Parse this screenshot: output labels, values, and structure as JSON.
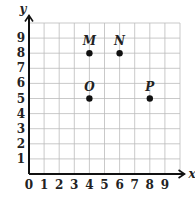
{
  "chart_data": {
    "type": "scatter",
    "title": "",
    "xlabel": "x",
    "ylabel": "y",
    "xlim": [
      0,
      10
    ],
    "ylim": [
      0,
      10
    ],
    "grid": true,
    "x_ticks": [
      "0",
      "1",
      "2",
      "3",
      "4",
      "5",
      "6",
      "7",
      "8",
      "9"
    ],
    "y_ticks": [
      "1",
      "2",
      "3",
      "4",
      "5",
      "6",
      "7",
      "8",
      "9"
    ],
    "points": [
      {
        "label": "M",
        "x": 4,
        "y": 8
      },
      {
        "label": "N",
        "x": 6,
        "y": 8
      },
      {
        "label": "O",
        "x": 4,
        "y": 5
      },
      {
        "label": "P",
        "x": 8,
        "y": 5
      }
    ]
  }
}
